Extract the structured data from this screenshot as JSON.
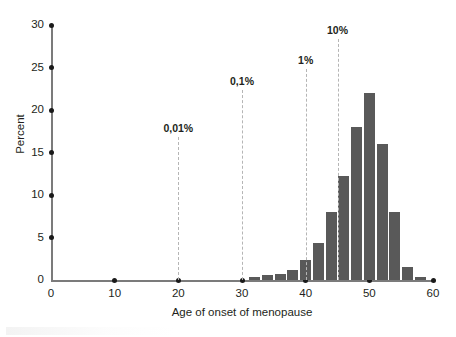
{
  "chart_data": {
    "type": "bar",
    "title": "",
    "xlabel": "Age of onset of menopause",
    "ylabel": "Percent",
    "xlim": [
      0,
      60
    ],
    "ylim": [
      0,
      30
    ],
    "grid": false,
    "legend": "none",
    "bar_color": "#595959",
    "axis_color": "#7b7b7b",
    "x_ticks": [
      0,
      10,
      20,
      30,
      40,
      50,
      60
    ],
    "x_tick_labels": [
      "0",
      "10",
      "20",
      "30",
      "40",
      "50",
      "60"
    ],
    "y_ticks": [
      0,
      5,
      10,
      15,
      20,
      25,
      30
    ],
    "y_tick_labels": [
      "0",
      "5",
      "10",
      "15",
      "20",
      "25",
      "30"
    ],
    "bin_width": 2,
    "bars": [
      {
        "x0": 31,
        "x1": 33,
        "value": 0.3
      },
      {
        "x0": 33,
        "x1": 35,
        "value": 0.6
      },
      {
        "x0": 35,
        "x1": 37,
        "value": 0.7
      },
      {
        "x0": 37,
        "x1": 39,
        "value": 1.2
      },
      {
        "x0": 39,
        "x1": 41,
        "value": 2.3
      },
      {
        "x0": 41,
        "x1": 43,
        "value": 4.4
      },
      {
        "x0": 43,
        "x1": 45,
        "value": 8.0
      },
      {
        "x0": 45,
        "x1": 47,
        "value": 12.2
      },
      {
        "x0": 47,
        "x1": 49,
        "value": 18.0
      },
      {
        "x0": 49,
        "x1": 51,
        "value": 22.0
      },
      {
        "x0": 51,
        "x1": 53,
        "value": 16.0
      },
      {
        "x0": 53,
        "x1": 55,
        "value": 8.0
      },
      {
        "x0": 55,
        "x1": 57,
        "value": 1.5
      },
      {
        "x0": 57,
        "x1": 59,
        "value": 0.35
      }
    ],
    "annotations": [
      {
        "label": "0,01%",
        "x": 20,
        "label_y": 18.0
      },
      {
        "label": "0,1%",
        "x": 30,
        "label_y": 23.5
      },
      {
        "label": "1%",
        "x": 40,
        "label_y": 26.0
      },
      {
        "label": "10%",
        "x": 45,
        "label_y": 29.5
      }
    ]
  }
}
